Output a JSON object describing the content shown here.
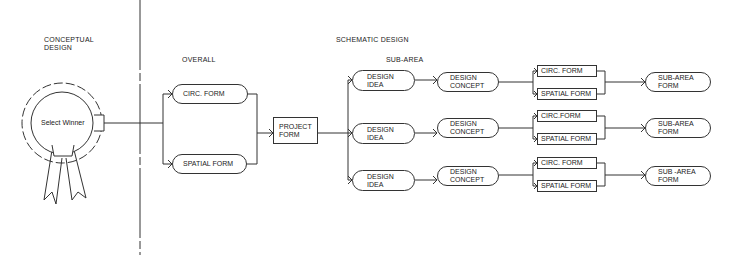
{
  "phases": {
    "conceptual": "CONCEPTUAL\nDESIGN",
    "schematic": "SCHEMATIC DESIGN"
  },
  "sections": {
    "overall": "OVERALL",
    "sub_area": "SUB-AREA"
  },
  "rosette": {
    "label": "Select Winner"
  },
  "overall_nodes": [
    {
      "label": "CIRC. FORM"
    },
    {
      "label": "SPATIAL FORM"
    }
  ],
  "project_form": {
    "label": "PROJECT\nFORM"
  },
  "rows": [
    {
      "idea": "DESIGN\nIDEA",
      "concept": "DESIGN\nCONCEPT",
      "circ": "CIRC. FORM",
      "spatial": "SPATIAL FORM",
      "result": "SUB-AREA\nFORM"
    },
    {
      "idea": "DESIGN\nIDEA",
      "concept": "DESIGN\nCONCEPT",
      "circ": "CIRC.FORM",
      "spatial": "SPATIAL FORM",
      "result": "SUB-AREA\nFORM"
    },
    {
      "idea": "DESIGN\nIDEA",
      "concept": "DESIGN\nCONCEPT",
      "circ": "CIRC. FORM",
      "spatial": "SPATIAL FORM",
      "result": "SUB -AREA\nFORM"
    }
  ],
  "colors": {
    "line": "#333333",
    "text": "#222222",
    "background": "#ffffff"
  }
}
